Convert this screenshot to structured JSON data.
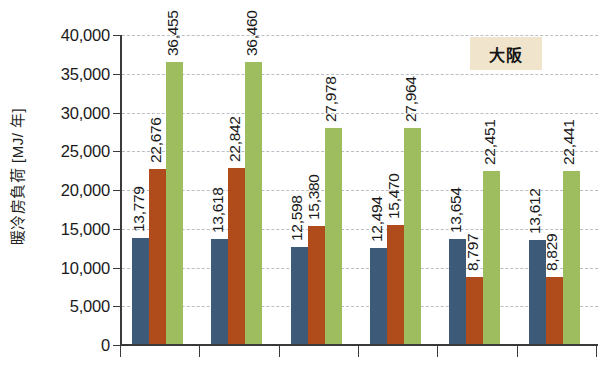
{
  "chart_data": {
    "type": "bar",
    "title": "",
    "subtitle": "",
    "xlabel": "",
    "ylabel": "暖冷房負荷 [MJ/ 年]",
    "ylim": [
      0,
      40000
    ],
    "ytick_values": [
      0,
      5000,
      10000,
      15000,
      20000,
      25000,
      30000,
      35000,
      40000
    ],
    "ytick_labels": [
      "0",
      "5,000",
      "10,000",
      "15,000",
      "20,000",
      "25,000",
      "30,000",
      "35,000",
      "40,000"
    ],
    "grid": true,
    "grid_axis": "y",
    "legend": false,
    "legend_position": "none",
    "annotations": [
      {
        "name": "region-label",
        "text": "大阪",
        "background": "#f0e4cd"
      }
    ],
    "categories": [
      "",
      "",
      "",
      "",
      "",
      ""
    ],
    "n_groups": 6,
    "bars_per_group": 3,
    "colors": [
      "#3d5a78",
      "#b04c1c",
      "#9dbd5e"
    ],
    "series": [
      {
        "name": "series-1",
        "color": "#3d5a78",
        "values": [
          13779,
          13618,
          12598,
          12494,
          13654,
          13612
        ],
        "labels": [
          "13,779",
          "13,618",
          "12,598",
          "12,494",
          "13,654",
          "13,612"
        ]
      },
      {
        "name": "series-2",
        "color": "#b04c1c",
        "values": [
          22676,
          22842,
          15380,
          15470,
          8797,
          8829
        ],
        "labels": [
          "22,676",
          "22,842",
          "15,380",
          "15,470",
          "8,797",
          "8,829"
        ]
      },
      {
        "name": "series-3",
        "color": "#9dbd5e",
        "values": [
          36455,
          36460,
          27978,
          27964,
          22451,
          22441
        ],
        "labels": [
          "36,455",
          "36,460",
          "27,978",
          "27,964",
          "22,451",
          "22,441"
        ]
      }
    ],
    "data_label_rotation": -90,
    "data_labels_visible": true
  }
}
